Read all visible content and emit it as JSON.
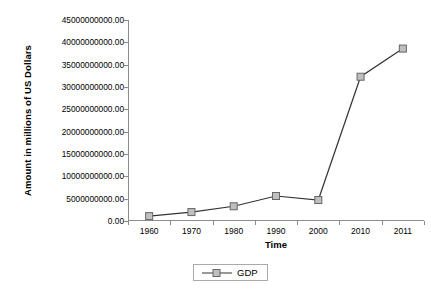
{
  "chart_data": {
    "type": "line",
    "title": "",
    "xlabel": "Time",
    "ylabel": "Amount in millions of US Dollars",
    "categories": [
      "1960",
      "1970",
      "1980",
      "1990",
      "2000",
      "2010",
      "2011"
    ],
    "series": [
      {
        "name": "GDP",
        "values": [
          1100000000.0,
          2000000000.0,
          3300000000.0,
          5600000000.0,
          4700000000.0,
          32300000000.0,
          38600000000.0
        ]
      }
    ],
    "ylim": [
      0,
      45000000000
    ],
    "ytick_labels": [
      "0.00",
      "5000000000.00",
      "10000000000.00",
      "15000000000.00",
      "20000000000.00",
      "25000000000.00",
      "30000000000.00",
      "35000000000.00",
      "40000000000.00",
      "45000000000.00"
    ],
    "ytick_values": [
      0,
      5000000000,
      10000000000,
      15000000000,
      20000000000,
      25000000000,
      30000000000,
      35000000000,
      40000000000,
      45000000000
    ],
    "grid": false,
    "legend_position": "bottom-center",
    "legend_entries": [
      "GDP"
    ],
    "colors": {
      "line": "#333333",
      "marker_fill": "#bfbfbf",
      "marker_stroke": "#666666",
      "axis": "#8c8c8c",
      "text": "#000000",
      "legend_border": "#aaaaaa",
      "background": "#ffffff"
    }
  }
}
